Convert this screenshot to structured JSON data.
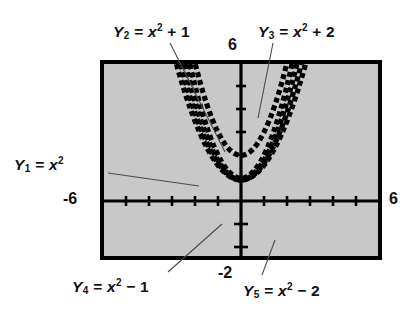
{
  "figure": {
    "plot_background_color": "#c8c8c8",
    "frame_color": "#000000",
    "curve_color": "#000000"
  },
  "axis_numbers": {
    "top": "6",
    "left": "-6",
    "right": "6",
    "bottom": "-2"
  },
  "labels": {
    "y1": {
      "var": "Y",
      "sub": "1",
      "eq": "=",
      "base": "x",
      "exp": "2",
      "op": "",
      "const": ""
    },
    "y2": {
      "var": "Y",
      "sub": "2",
      "eq": "=",
      "base": "x",
      "exp": "2",
      "op": "+",
      "const": "1"
    },
    "y3": {
      "var": "Y",
      "sub": "3",
      "eq": "=",
      "base": "x",
      "exp": "2",
      "op": "+",
      "const": "2"
    },
    "y4": {
      "var": "Y",
      "sub": "4",
      "eq": "=",
      "base": "x",
      "exp": "2",
      "op": "−",
      "const": "1"
    },
    "y5": {
      "var": "Y",
      "sub": "5",
      "eq": "=",
      "base": "x",
      "exp": "2",
      "op": "−",
      "const": "2"
    }
  },
  "chart_data": {
    "type": "line",
    "title": "",
    "xlabel": "",
    "ylabel": "",
    "xlim": [
      -6,
      6
    ],
    "ylim": [
      -4.2,
      4.2
    ],
    "xticks": [
      -6,
      -5,
      -4,
      -3,
      -2,
      -1,
      0,
      1,
      2,
      3,
      4,
      5,
      6
    ],
    "yticks": [
      -4,
      -3,
      -2,
      -1,
      0,
      1,
      2,
      3,
      4
    ],
    "grid": false,
    "legend": "annotated-callouts",
    "window_note": "Calculator viewing window: x from -6 to 6, y axis shown with unit tick marks",
    "series": [
      {
        "name": "Y1 = x^2",
        "vertex": [
          0,
          0
        ],
        "k": 0,
        "x": [
          -2.1,
          -1.8,
          -1.5,
          -1.2,
          -0.9,
          -0.6,
          -0.3,
          0,
          0.3,
          0.6,
          0.9,
          1.2,
          1.5,
          1.8,
          2.1
        ],
        "values": [
          4.41,
          3.24,
          2.25,
          1.44,
          0.81,
          0.36,
          0.09,
          0,
          0.09,
          0.36,
          0.81,
          1.44,
          2.25,
          3.24,
          4.41
        ]
      },
      {
        "name": "Y2 = x^2 + 1",
        "vertex": [
          0,
          1
        ],
        "k": 1,
        "x": [
          -1.8,
          -1.5,
          -1.2,
          -0.9,
          -0.6,
          -0.3,
          0,
          0.3,
          0.6,
          0.9,
          1.2,
          1.5,
          1.8
        ],
        "values": [
          4.24,
          3.25,
          2.44,
          1.81,
          1.36,
          1.09,
          1,
          1.09,
          1.36,
          1.81,
          2.44,
          3.25,
          4.24
        ]
      },
      {
        "name": "Y3 = x^2 + 2",
        "vertex": [
          0,
          2
        ],
        "k": 2,
        "x": [
          -1.5,
          -1.2,
          -0.9,
          -0.6,
          -0.3,
          0,
          0.3,
          0.6,
          0.9,
          1.2,
          1.5
        ],
        "values": [
          4.25,
          3.44,
          2.81,
          2.36,
          2.09,
          2,
          2.09,
          2.36,
          2.81,
          3.44,
          4.25
        ]
      },
      {
        "name": "Y4 = x^2 - 1",
        "vertex": [
          0,
          -1
        ],
        "k": -1,
        "x": [
          -2.3,
          -2.0,
          -1.7,
          -1.4,
          -1.1,
          -0.8,
          -0.5,
          -0.2,
          0,
          0.2,
          0.5,
          0.8,
          1.1,
          1.4,
          1.7,
          2.0,
          2.3
        ],
        "values": [
          4.29,
          3.0,
          1.89,
          0.96,
          0.21,
          -0.36,
          -0.75,
          -0.96,
          -1,
          -0.96,
          -0.75,
          -0.36,
          0.21,
          0.96,
          1.89,
          3.0,
          4.29
        ]
      },
      {
        "name": "Y5 = x^2 - 2",
        "vertex": [
          0,
          -2
        ],
        "k": -2,
        "x": [
          -2.5,
          -2.2,
          -1.9,
          -1.6,
          -1.3,
          -1.0,
          -0.7,
          -0.4,
          0,
          0.4,
          0.7,
          1.0,
          1.3,
          1.6,
          1.9,
          2.2,
          2.5
        ],
        "values": [
          4.25,
          2.84,
          1.61,
          0.56,
          -0.31,
          -1.0,
          -1.51,
          -1.84,
          -2,
          -1.84,
          -1.51,
          -1.0,
          -0.31,
          0.56,
          1.61,
          2.84,
          4.25
        ]
      }
    ]
  }
}
